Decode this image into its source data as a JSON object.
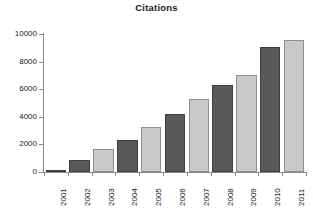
{
  "chart_data": {
    "type": "bar",
    "title": "Citations",
    "xlabel": "",
    "ylabel": "",
    "categories": [
      "2001",
      "2002",
      "2003",
      "2004",
      "2005",
      "2006",
      "2007",
      "2008",
      "2009",
      "2010",
      "2011"
    ],
    "values": [
      150,
      880,
      1650,
      2300,
      3250,
      4200,
      5280,
      6320,
      7050,
      9030,
      9600
    ],
    "ylim": [
      0,
      10000
    ],
    "ytick_labels": [
      "10000",
      "8000",
      "6000",
      "4000",
      "2000",
      "0"
    ],
    "ytick_values": [
      10000,
      8000,
      6000,
      4000,
      2000,
      0
    ],
    "grid": false,
    "legend": "none",
    "bar_colors": [
      "dark",
      "dark",
      "light",
      "dark",
      "light",
      "dark",
      "light",
      "dark",
      "light",
      "dark",
      "light"
    ],
    "colors": {
      "dark_bar": "#595959",
      "light_bar": "#c9c9c9",
      "dark_bar_border": "#3f3f3f",
      "light_bar_border": "#8e8e8e",
      "axis": "#8a8a8a",
      "text": "#1a1a1a",
      "background": "#ffffff"
    }
  }
}
